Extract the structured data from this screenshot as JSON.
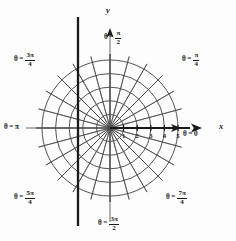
{
  "figure": {
    "background_color": "#fdfdfd",
    "ink_color": "#1a1a1a",
    "grid_color": "#4a4a4a"
  },
  "axes": {
    "x_label": "x",
    "y_label": "y"
  },
  "ray_labels": [
    {
      "id": "theta-0",
      "theta_symbol": "θ",
      "equals": "=",
      "value": "0",
      "kind": "plain",
      "x": 183,
      "y": 131,
      "deg": 0
    },
    {
      "id": "theta-pi-4",
      "theta_symbol": "θ",
      "equals": "=",
      "num": "π",
      "den": "4",
      "kind": "fraction",
      "x": 182,
      "y": 52,
      "deg": 45
    },
    {
      "id": "theta-pi-2",
      "theta_symbol": "θ",
      "equals": "=",
      "num": "π",
      "den": "2",
      "kind": "fraction",
      "x": 104,
      "y": 30,
      "deg": 90
    },
    {
      "id": "theta-3pi-4",
      "theta_symbol": "θ",
      "equals": "=",
      "num": "3π",
      "den": "4",
      "kind": "fraction",
      "x": 14,
      "y": 52,
      "deg": 135
    },
    {
      "id": "theta-pi",
      "theta_symbol": "θ",
      "equals": "=",
      "value": "π",
      "kind": "plain",
      "x": 4,
      "y": 124,
      "deg": 180
    },
    {
      "id": "theta-5pi-4",
      "theta_symbol": "θ",
      "equals": "=",
      "num": "5π",
      "den": "4",
      "kind": "fraction",
      "x": 14,
      "y": 190,
      "deg": 225
    },
    {
      "id": "theta-3pi-2",
      "theta_symbol": "θ",
      "equals": "=",
      "num": "3π",
      "den": "2",
      "kind": "fraction",
      "x": 98,
      "y": 216,
      "deg": 270
    },
    {
      "id": "theta-7pi-4",
      "theta_symbol": "θ",
      "equals": "=",
      "num": "7π",
      "den": "4",
      "kind": "fraction",
      "x": 166,
      "y": 190,
      "deg": 315
    }
  ],
  "radial_ticks": [
    {
      "label": "1",
      "r": 1
    },
    {
      "label": "2",
      "r": 2
    },
    {
      "label": "3",
      "r": 3
    },
    {
      "label": "4",
      "r": 4
    },
    {
      "label": "5",
      "r": 5
    }
  ],
  "chart_data": {
    "type": "line",
    "xlabel": "x",
    "ylabel": "y",
    "grid": true,
    "legend": "none",
    "origin_px": {
      "x": 110,
      "y": 128
    },
    "pixels_per_unit": 13.6,
    "circles_r": [
      1,
      2,
      3,
      4,
      5
    ],
    "ray_angles_deg": [
      0,
      15,
      30,
      45,
      60,
      75,
      90,
      105,
      120,
      135,
      150,
      165,
      180,
      195,
      210,
      225,
      240,
      255,
      270,
      285,
      300,
      315,
      330,
      345
    ],
    "labeled_ray_angles_deg": [
      0,
      45,
      90,
      135,
      180,
      225,
      270,
      315
    ],
    "xlim": [
      -5,
      5
    ],
    "ylim": [
      -5,
      5
    ],
    "annotations": [
      {
        "text": "vertical line x = -2.35",
        "type": "heavy-vertical-line",
        "x_value": -2.35
      }
    ]
  }
}
